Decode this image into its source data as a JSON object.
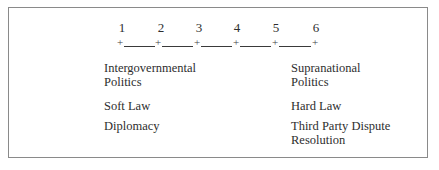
{
  "diagram": {
    "scale": {
      "points": [
        "1",
        "2",
        "3",
        "4",
        "5",
        "6"
      ],
      "tick_glyph": "+"
    },
    "rows": [
      {
        "left": [
          "Intergovernmental",
          "Politics"
        ],
        "right": [
          "Supranational",
          "Politics"
        ]
      },
      {
        "left": [
          "Soft Law"
        ],
        "right": [
          "Hard Law"
        ]
      },
      {
        "left": [
          "Diplomacy"
        ],
        "right": [
          "Third Party Dispute",
          "Resolution"
        ]
      }
    ]
  }
}
